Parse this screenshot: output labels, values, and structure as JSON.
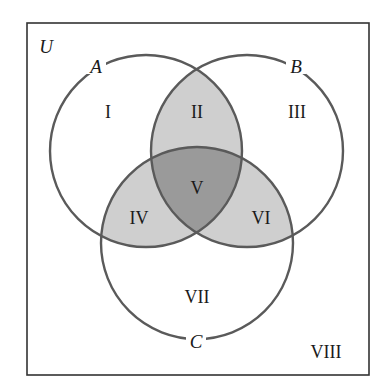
{
  "diagram": {
    "type": "venn",
    "universe_label": "U",
    "sets": [
      {
        "label": "A",
        "cx": 146,
        "cy": 151,
        "r": 96
      },
      {
        "label": "B",
        "cx": 247,
        "cy": 151,
        "r": 96
      },
      {
        "label": "C",
        "cx": 197,
        "cy": 243,
        "r": 96
      }
    ],
    "regions": [
      {
        "label": "I",
        "description": "A only"
      },
      {
        "label": "II",
        "description": "A and B only"
      },
      {
        "label": "III",
        "description": "B only"
      },
      {
        "label": "IV",
        "description": "A and C only"
      },
      {
        "label": "V",
        "description": "A, B and C"
      },
      {
        "label": "VI",
        "description": "B and C only"
      },
      {
        "label": "VII",
        "description": "C only"
      },
      {
        "label": "VIII",
        "description": "outside A, B and C"
      }
    ],
    "colors": {
      "background": "#ffffff",
      "border": "#333333",
      "circle_stroke": "#5a5a5a",
      "pair_overlap_fill": "#cfcfcf",
      "triple_overlap_fill": "#9a9a9a",
      "text": "#1a1a1a"
    }
  }
}
